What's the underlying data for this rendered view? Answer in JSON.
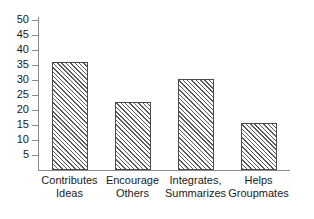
{
  "chart_data": {
    "type": "bar",
    "title": "",
    "subtitle": "",
    "xlabel": "",
    "ylabel": "",
    "categories": [
      "Contributes\nIdeas",
      "Encourage\nOthers",
      "Integrates,\nSummarizes",
      "Helps\nGroupmates"
    ],
    "values": [
      36,
      22.8,
      30.5,
      15.6
    ],
    "ylim": [
      0,
      50
    ],
    "yticks": [
      5,
      10,
      15,
      20,
      25,
      30,
      35,
      40,
      45,
      50
    ],
    "ytick_labels": [
      "5",
      "10",
      "15",
      "20",
      "25",
      "30",
      "35",
      "40",
      "45",
      "50"
    ],
    "grid": false,
    "legend": false,
    "legend_position": "none",
    "bar_fill": "diagonal-hatch",
    "bar_edge_color": "#4a4a4a",
    "axis_color": "#8a8a8a",
    "text_color": "#1b1b1b",
    "background": "#ffffff"
  }
}
